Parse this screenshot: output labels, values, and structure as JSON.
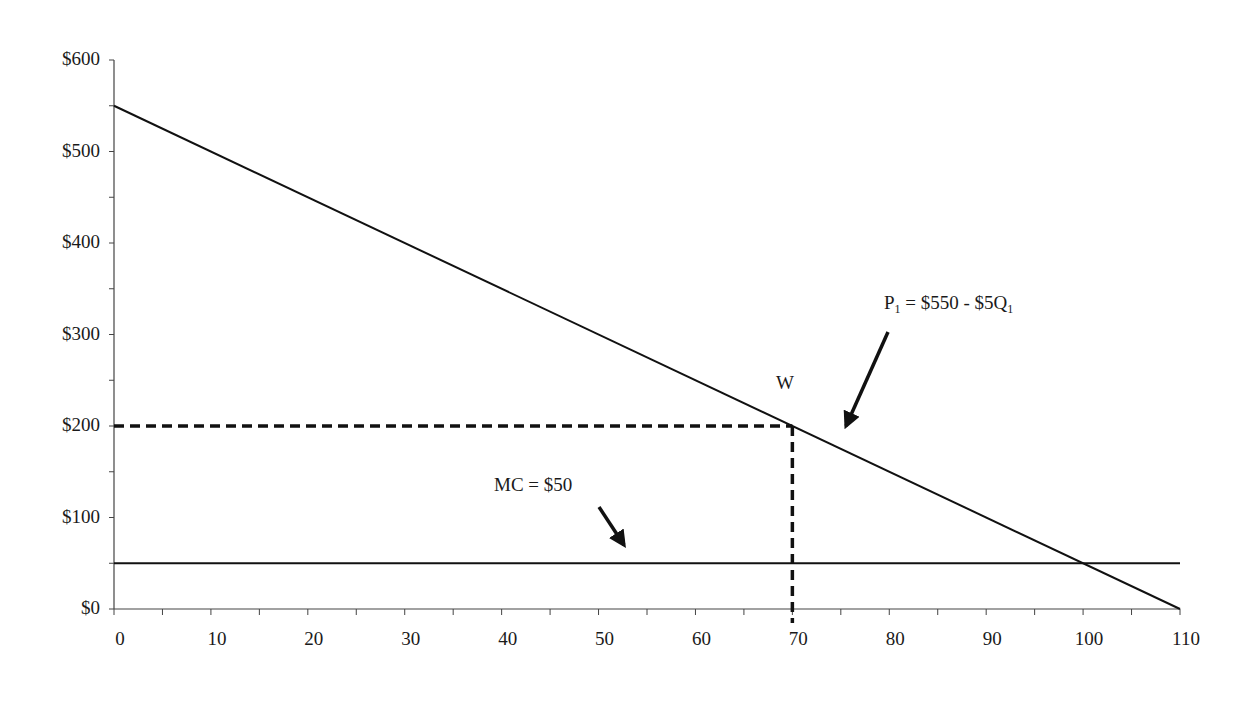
{
  "chart_data": {
    "type": "line",
    "title": "",
    "xlabel": "",
    "ylabel": "",
    "xlim": [
      0,
      110
    ],
    "ylim": [
      0,
      600
    ],
    "grid": false,
    "legend": null,
    "x_ticks": [
      0,
      10,
      20,
      30,
      40,
      50,
      60,
      70,
      80,
      90,
      100,
      110
    ],
    "x_tick_labels": [
      "0",
      "10",
      "20",
      "30",
      "40",
      "50",
      "60",
      "70",
      "80",
      "90",
      "100",
      "110"
    ],
    "x_minor_tick_step": 5,
    "y_ticks": [
      0,
      100,
      200,
      300,
      400,
      500,
      600
    ],
    "y_tick_labels": [
      "$0",
      "$100",
      "$200",
      "$300",
      "$400",
      "$500",
      "$600"
    ],
    "y_minor_tick_step": 50,
    "series": [
      {
        "name": "Demand P1 = $550 - $5Q1",
        "style": "solid",
        "x": [
          0,
          110
        ],
        "y": [
          550,
          0
        ]
      },
      {
        "name": "MC = $50",
        "style": "solid",
        "x": [
          0,
          110
        ],
        "y": [
          50,
          50
        ]
      },
      {
        "name": "Reference price at W",
        "style": "dashed",
        "x": [
          0,
          70
        ],
        "y": [
          200,
          200
        ]
      },
      {
        "name": "Reference quantity at W",
        "style": "dashed",
        "x": [
          70,
          70
        ],
        "y": [
          200,
          0
        ]
      }
    ],
    "annotations": [
      {
        "text": "W",
        "x": 70,
        "y": 200,
        "position": "above point"
      },
      {
        "text": "P1 = $550 - $5Q1",
        "arrow_to": "demand line near Q=75"
      },
      {
        "text": "MC = $50",
        "arrow_to": "MC line near Q=53"
      }
    ],
    "points": [
      {
        "label": "W",
        "x": 70,
        "y": 200
      }
    ]
  },
  "labels": {
    "demand_p": "P",
    "demand_sub": "1",
    "demand_rest": " = $550 - $5Q",
    "demand_sub2": "1",
    "mc": "MC = $50",
    "point_w": "W"
  }
}
